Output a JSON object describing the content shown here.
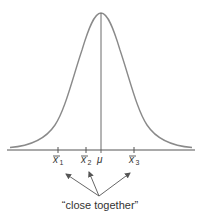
{
  "diagram": {
    "type": "normal-distribution",
    "colors": {
      "curve": "#8a8a8a",
      "axis": "#555555",
      "text": "#333333",
      "arrow": "#555555"
    },
    "center_label": "μ",
    "sample_means": [
      {
        "base": "x",
        "sub": "1"
      },
      {
        "base": "x",
        "sub": "2"
      },
      {
        "base": "x",
        "sub": "3"
      }
    ],
    "annotation": "“close together”"
  }
}
